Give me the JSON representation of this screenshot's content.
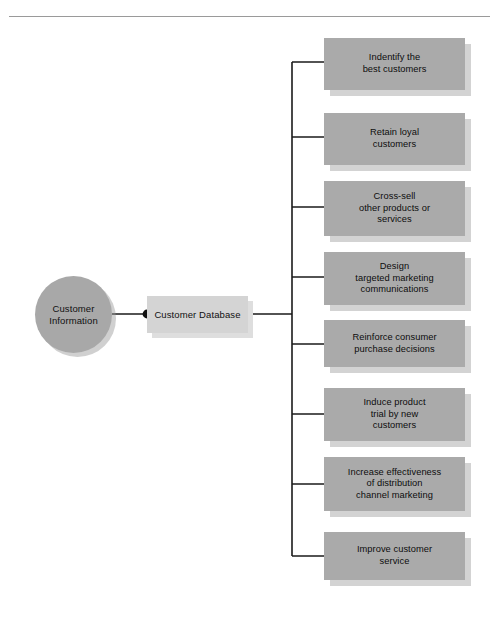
{
  "diagram": {
    "title_rule": "horizontal-rule",
    "source": {
      "label": "Customer\nInformation",
      "line1": "Customer",
      "line2": "Information",
      "shape": "circle",
      "color": "#a8a8a8"
    },
    "hub": {
      "label": "Customer Database",
      "shape": "rectangle",
      "color": "#d4d4d4"
    },
    "outcome_color": "#aaaaaa",
    "connector_color": "#1a1a1a",
    "outcomes": [
      {
        "id": "identify-best-customers",
        "lines": [
          "Indentify the",
          "best customers"
        ],
        "top": 38,
        "height": 52,
        "dot_y": 62
      },
      {
        "id": "retain-loyal-customers",
        "lines": [
          "Retain loyal",
          "customers"
        ],
        "top": 113,
        "height": 52,
        "dot_y": 137
      },
      {
        "id": "cross-sell-products",
        "lines": [
          "Cross-sell",
          "other products or",
          "services"
        ],
        "top": 181,
        "height": 55,
        "dot_y": 207
      },
      {
        "id": "design-targeted-marketing",
        "lines": [
          "Design",
          "targeted marketing",
          "communications"
        ],
        "top": 252,
        "height": 53,
        "dot_y": 277
      },
      {
        "id": "reinforce-purchase-decisions",
        "lines": [
          "Reinforce consumer",
          "purchase decisions"
        ],
        "top": 320,
        "height": 47,
        "dot_y": 344
      },
      {
        "id": "induce-product-trial",
        "lines": [
          "Induce product",
          "trial by new",
          "customers"
        ],
        "top": 388,
        "height": 53,
        "dot_y": 414
      },
      {
        "id": "increase-distribution-effectiveness",
        "lines": [
          "Increase effectiveness",
          "of distribution",
          "channel marketing"
        ],
        "top": 457,
        "height": 54,
        "dot_y": 484
      },
      {
        "id": "improve-customer-service",
        "lines": [
          "Improve customer",
          "service"
        ],
        "top": 532,
        "height": 48,
        "dot_y": 556
      }
    ]
  }
}
